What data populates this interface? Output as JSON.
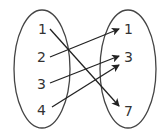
{
  "diagram": {
    "type": "mapping",
    "domain_set": [
      "1",
      "2",
      "3",
      "4"
    ],
    "range_set": [
      "1",
      "3",
      "7"
    ],
    "mappings": [
      {
        "from": "1",
        "to": "7"
      },
      {
        "from": "2",
        "to": "1"
      },
      {
        "from": "3",
        "to": "3"
      },
      {
        "from": "4",
        "to": "3"
      }
    ],
    "colors": {
      "stroke": "#333333",
      "background": "#ffffff"
    }
  }
}
